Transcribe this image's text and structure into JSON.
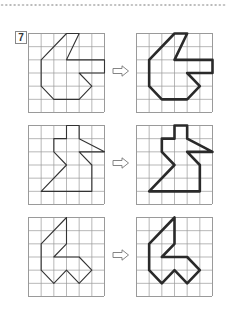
{
  "problem": {
    "number": "7",
    "grid": {
      "cols": 6,
      "rows": 6
    },
    "rows": [
      {
        "shape": [
          [
            3,
            0
          ],
          [
            4,
            0
          ],
          [
            3,
            2
          ],
          [
            6,
            2
          ],
          [
            6,
            3
          ],
          [
            4,
            3
          ],
          [
            5,
            4
          ],
          [
            4,
            5
          ],
          [
            2,
            5
          ],
          [
            1,
            4
          ],
          [
            1,
            2
          ]
        ]
      },
      {
        "shape": [
          [
            3,
            0
          ],
          [
            4,
            0
          ],
          [
            4,
            1
          ],
          [
            6,
            2
          ],
          [
            4,
            2
          ],
          [
            5,
            3
          ],
          [
            5,
            5
          ],
          [
            1,
            5
          ],
          [
            3,
            3
          ],
          [
            2,
            2
          ],
          [
            2,
            1
          ],
          [
            3,
            1
          ]
        ]
      },
      {
        "shape": [
          [
            3,
            0
          ],
          [
            3,
            2
          ],
          [
            2,
            3
          ],
          [
            4,
            3
          ],
          [
            5,
            4
          ],
          [
            4,
            5
          ],
          [
            3,
            4
          ],
          [
            2,
            5
          ],
          [
            1,
            4
          ],
          [
            1,
            2
          ]
        ]
      }
    ],
    "arrow_icon": "right-arrow-icon"
  },
  "colors": {
    "grid_line": "#9a9a9a",
    "thin_outline": "#333333",
    "thick_outline": "#2a2a2a",
    "dots": "#b8b8b8"
  }
}
